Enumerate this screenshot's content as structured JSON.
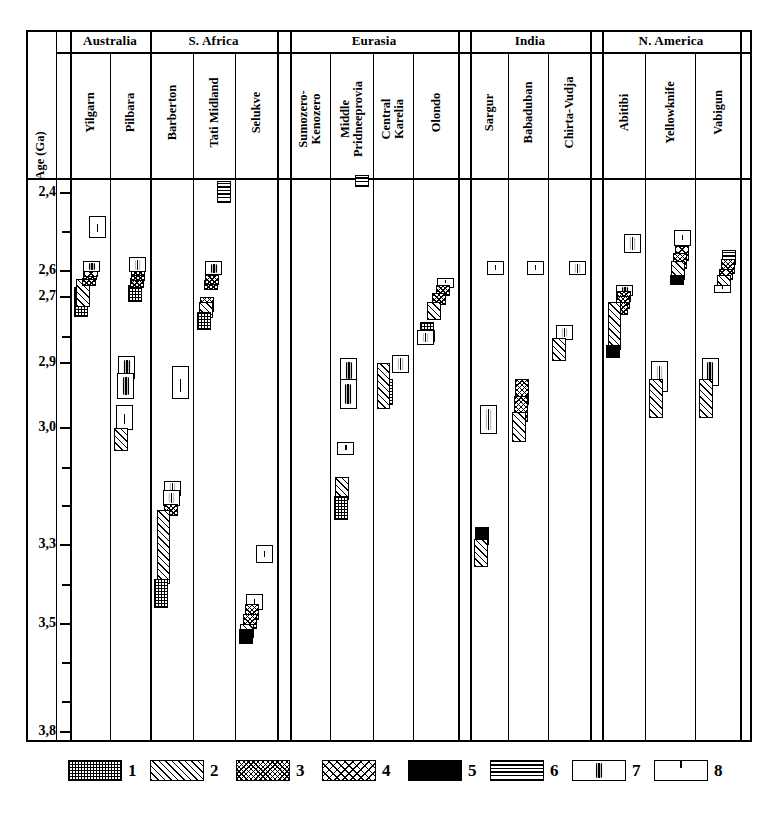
{
  "chart_data": {
    "type": "table",
    "ylabel": "Age (Ga)",
    "ylim": [
      2.4,
      3.8
    ],
    "axis_direction": "inverted",
    "tick_labels": [
      "2,4",
      "2,6",
      "2,7",
      "2,9",
      "3,0",
      "3,3",
      "3,5",
      "3,8"
    ],
    "tick_values": [
      2.4,
      2.6,
      2.7,
      2.9,
      3.0,
      3.3,
      3.5,
      3.8
    ],
    "tick_y_px": [
      193,
      271,
      297,
      363,
      428,
      545,
      624,
      732
    ],
    "minor_tick_y_px": [
      232,
      337,
      468,
      506,
      585,
      663,
      702
    ],
    "regions": [
      {
        "name": "Australia",
        "columns": [
          "Yilgarn",
          "Pilbara"
        ]
      },
      {
        "name": "S. Africa",
        "columns": [
          "Barberton",
          "Tati Midland",
          "Selukve"
        ]
      },
      {
        "name": "Eurasia",
        "columns": [
          "Sumozero-\nKenozero",
          "Middle\nPridneeprovia",
          "Central\nKarelia",
          "Olondo"
        ]
      },
      {
        "name": "India",
        "columns": [
          "Sargur",
          "Babaduban",
          "Chirta-Vudja"
        ]
      },
      {
        "name": "N. America",
        "columns": [
          "Abitibi",
          "Yellowknife",
          "Vabigun"
        ]
      }
    ],
    "legend": [
      {
        "id": "1",
        "pattern": "checker-grid"
      },
      {
        "id": "2",
        "pattern": "diagonal-hatch"
      },
      {
        "id": "3",
        "pattern": "dense-speckle"
      },
      {
        "id": "4",
        "pattern": "sparse-speckle"
      },
      {
        "id": "5",
        "pattern": "solid-black"
      },
      {
        "id": "6",
        "pattern": "horizontal-lines"
      },
      {
        "id": "7",
        "pattern": "box-vertical-tick"
      },
      {
        "id": "8",
        "pattern": "box-small-dash"
      }
    ],
    "series": [
      {
        "column": "Yilgarn",
        "blocks": [
          {
            "pattern": 1,
            "top_age": 2.66,
            "bottom_age": 2.76
          },
          {
            "pattern": 2,
            "top_age": 2.63,
            "bottom_age": 2.73
          },
          {
            "pattern": 3,
            "top_age": 2.625,
            "bottom_age": 2.655
          },
          {
            "pattern": 3,
            "top_age": 2.605,
            "bottom_age": 2.635
          },
          {
            "pattern": 4,
            "top_age": 2.595,
            "bottom_age": 2.625
          },
          {
            "pattern": 7,
            "top_age": 2.575,
            "bottom_age": 2.605
          },
          {
            "pattern": 8,
            "top_age": 2.46,
            "bottom_age": 2.515
          }
        ]
      },
      {
        "column": "Pilbara",
        "blocks": [
          {
            "pattern": 1,
            "top_age": 2.655,
            "bottom_age": 2.715
          },
          {
            "pattern": 3,
            "top_age": 2.625,
            "bottom_age": 2.665
          },
          {
            "pattern": 3,
            "top_age": 2.6,
            "bottom_age": 2.64
          },
          {
            "pattern": 3,
            "top_age": 2.585,
            "bottom_age": 2.62
          },
          {
            "pattern": 7,
            "top_age": 2.565,
            "bottom_age": 2.605
          },
          {
            "pattern": 7,
            "top_age": 2.88,
            "bottom_age": 2.925
          },
          {
            "pattern": 7,
            "top_age": 2.915,
            "bottom_age": 2.955
          },
          {
            "pattern": 8,
            "top_age": 2.965,
            "bottom_age": 3.005
          },
          {
            "pattern": 2,
            "top_age": 3.0,
            "bottom_age": 3.06
          }
        ]
      },
      {
        "column": "Barberton",
        "blocks": [
          {
            "pattern": 8,
            "top_age": 2.905,
            "bottom_age": 2.955
          },
          {
            "pattern": 7,
            "top_age": 3.135,
            "bottom_age": 3.175
          },
          {
            "pattern": 7,
            "top_age": 3.16,
            "bottom_age": 3.2
          },
          {
            "pattern": 3,
            "top_age": 3.195,
            "bottom_age": 3.225
          },
          {
            "pattern": 2,
            "top_age": 3.21,
            "bottom_age": 3.4
          },
          {
            "pattern": 1,
            "top_age": 3.385,
            "bottom_age": 3.46
          }
        ]
      },
      {
        "column": "Tati Midland",
        "blocks": [
          {
            "pattern": 6,
            "top_age": 2.37,
            "bottom_age": 2.425
          },
          {
            "pattern": 3,
            "top_age": 2.635,
            "bottom_age": 2.675
          },
          {
            "pattern": 3,
            "top_age": 2.615,
            "bottom_age": 2.655
          },
          {
            "pattern": 7,
            "top_age": 2.575,
            "bottom_age": 2.615
          },
          {
            "pattern": 3,
            "top_age": 2.7,
            "bottom_age": 2.745
          },
          {
            "pattern": 2,
            "top_age": 2.715,
            "bottom_age": 2.765
          },
          {
            "pattern": 1,
            "top_age": 2.745,
            "bottom_age": 2.8
          }
        ]
      },
      {
        "column": "Selukve",
        "blocks": [
          {
            "pattern": 8,
            "top_age": 3.3,
            "bottom_age": 3.345
          },
          {
            "pattern": 8,
            "top_age": 3.425,
            "bottom_age": 3.465
          },
          {
            "pattern": 3,
            "top_age": 3.45,
            "bottom_age": 3.49
          },
          {
            "pattern": 3,
            "top_age": 3.475,
            "bottom_age": 3.515
          },
          {
            "pattern": 2,
            "top_age": 3.5,
            "bottom_age": 3.54
          },
          {
            "pattern": 5,
            "top_age": 3.515,
            "bottom_age": 3.555
          }
        ]
      },
      {
        "column": "Sumozero-Kenozero",
        "blocks": [
          {
            "pattern": 6,
            "top_age": 2.37,
            "bottom_age": 2.425
          },
          {
            "pattern": 8,
            "top_age": 2.665,
            "bottom_age": 2.715
          },
          {
            "pattern": 7,
            "top_age": 2.8,
            "bottom_age": 2.845
          },
          {
            "pattern": 5,
            "top_age": 2.825,
            "bottom_age": 2.855
          },
          {
            "pattern": 3,
            "top_age": 2.835,
            "bottom_age": 2.87
          },
          {
            "pattern": 2,
            "top_age": 2.85,
            "bottom_age": 2.895
          },
          {
            "pattern": 1,
            "top_age": 2.875,
            "bottom_age": 2.925
          }
        ]
      },
      {
        "column": "Middle Pridneeprovia",
        "blocks": [
          {
            "pattern": 6,
            "top_age": 2.355,
            "bottom_age": 2.385
          },
          {
            "pattern": 7,
            "top_age": 2.885,
            "bottom_age": 2.93
          },
          {
            "pattern": 7,
            "top_age": 2.925,
            "bottom_age": 2.97
          },
          {
            "pattern": 8,
            "top_age": 3.035,
            "bottom_age": 3.07
          },
          {
            "pattern": 2,
            "top_age": 3.125,
            "bottom_age": 3.185
          },
          {
            "pattern": 1,
            "top_age": 3.175,
            "bottom_age": 3.235
          }
        ]
      },
      {
        "column": "Central Karelia",
        "blocks": [
          {
            "pattern": 1,
            "top_age": 2.925,
            "bottom_age": 2.965
          },
          {
            "pattern": 7,
            "top_age": 2.875,
            "bottom_age": 2.915
          },
          {
            "pattern": 2,
            "top_age": 2.9,
            "bottom_age": 2.97
          }
        ]
      },
      {
        "column": "Olondo",
        "blocks": [
          {
            "pattern": 8,
            "top_age": 2.8,
            "bottom_age": 2.835
          },
          {
            "pattern": 8,
            "top_age": 2.625,
            "bottom_age": 2.665
          },
          {
            "pattern": 3,
            "top_age": 2.655,
            "bottom_age": 2.695
          },
          {
            "pattern": 3,
            "top_age": 2.685,
            "bottom_age": 2.725
          },
          {
            "pattern": 2,
            "top_age": 2.715,
            "bottom_age": 2.77
          },
          {
            "pattern": 1,
            "top_age": 2.775,
            "bottom_age": 2.82
          },
          {
            "pattern": 7,
            "top_age": 2.8,
            "bottom_age": 2.845
          }
        ]
      },
      {
        "column": "Sargur",
        "blocks": [
          {
            "pattern": 8,
            "top_age": 2.575,
            "bottom_age": 2.615
          },
          {
            "pattern": 7,
            "top_age": 2.965,
            "bottom_age": 3.015
          },
          {
            "pattern": 5,
            "top_age": 3.255,
            "bottom_age": 3.3
          },
          {
            "pattern": 2,
            "top_age": 3.285,
            "bottom_age": 3.355
          }
        ]
      },
      {
        "column": "Babaduban",
        "blocks": [
          {
            "pattern": 8,
            "top_age": 2.575,
            "bottom_age": 2.615
          },
          {
            "pattern": 3,
            "top_age": 2.925,
            "bottom_age": 2.965
          },
          {
            "pattern": 3,
            "top_age": 2.95,
            "bottom_age": 2.99
          },
          {
            "pattern": 2,
            "top_age": 2.975,
            "bottom_age": 3.035
          }
        ]
      },
      {
        "column": "Chirta-Vudja",
        "blocks": [
          {
            "pattern": 7,
            "top_age": 2.575,
            "bottom_age": 2.615
          },
          {
            "pattern": 7,
            "top_age": 2.785,
            "bottom_age": 2.83
          },
          {
            "pattern": 2,
            "top_age": 2.825,
            "bottom_age": 2.895
          }
        ]
      },
      {
        "column": "Abitibi",
        "blocks": [
          {
            "pattern": 7,
            "top_age": 2.505,
            "bottom_age": 2.555
          },
          {
            "pattern": 7,
            "top_age": 2.655,
            "bottom_age": 2.695
          },
          {
            "pattern": 3,
            "top_age": 2.675,
            "bottom_age": 2.715
          },
          {
            "pattern": 3,
            "top_age": 2.695,
            "bottom_age": 2.735
          },
          {
            "pattern": 3,
            "top_age": 2.715,
            "bottom_age": 2.755
          },
          {
            "pattern": 2,
            "top_age": 2.715,
            "bottom_age": 2.86
          },
          {
            "pattern": 5,
            "top_age": 2.845,
            "bottom_age": 2.885
          }
        ]
      },
      {
        "column": "Yellowknife",
        "blocks": [
          {
            "pattern": 8,
            "top_age": 2.495,
            "bottom_age": 2.535
          },
          {
            "pattern": 4,
            "top_age": 2.535,
            "bottom_age": 2.575
          },
          {
            "pattern": 3,
            "top_age": 2.555,
            "bottom_age": 2.595
          },
          {
            "pattern": 2,
            "top_age": 2.575,
            "bottom_age": 2.635
          },
          {
            "pattern": 5,
            "top_age": 2.615,
            "bottom_age": 2.655
          },
          {
            "pattern": 7,
            "top_age": 2.895,
            "bottom_age": 2.945
          },
          {
            "pattern": 2,
            "top_age": 2.925,
            "bottom_age": 2.985
          }
        ]
      },
      {
        "column": "Vabigun",
        "blocks": [
          {
            "pattern": 6,
            "top_age": 2.545,
            "bottom_age": 2.585
          },
          {
            "pattern": 3,
            "top_age": 2.57,
            "bottom_age": 2.61
          },
          {
            "pattern": 4,
            "top_age": 2.595,
            "bottom_age": 2.635
          },
          {
            "pattern": 2,
            "top_age": 2.615,
            "bottom_age": 2.675
          },
          {
            "pattern": 8,
            "top_age": 2.655,
            "bottom_age": 2.685
          },
          {
            "pattern": 7,
            "top_age": 2.885,
            "bottom_age": 2.935
          },
          {
            "pattern": 2,
            "top_age": 2.925,
            "bottom_age": 2.985
          }
        ]
      }
    ]
  }
}
